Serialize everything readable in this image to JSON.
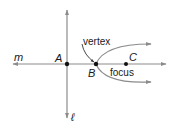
{
  "diagram": {
    "type": "geometry-parabola",
    "colors": {
      "line": "#8c8c8c",
      "point": "#111111",
      "text": "#1a1a1a"
    },
    "lines": {
      "horizontal": {
        "label": "m"
      },
      "vertical": {
        "label": "ℓ"
      }
    },
    "points": [
      {
        "id": "A",
        "label": "A"
      },
      {
        "id": "B",
        "label": "B"
      },
      {
        "id": "C",
        "label": "C"
      }
    ],
    "annotations": {
      "vertex": "vertex",
      "focus": "focus"
    }
  }
}
